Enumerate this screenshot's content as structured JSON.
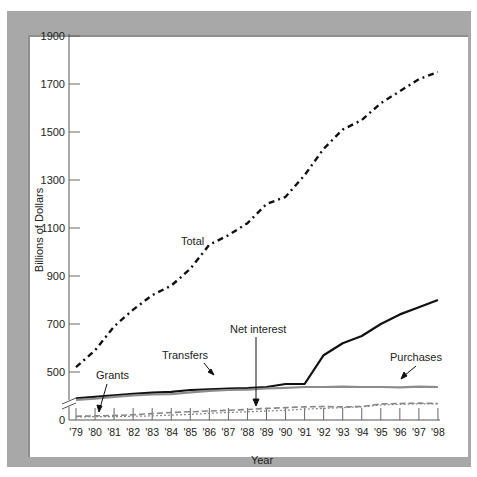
{
  "chart_data": {
    "type": "line",
    "title": "",
    "xlabel": "Year",
    "ylabel": "Billions of Dollars",
    "x": [
      "'79",
      "'80",
      "'81",
      "'82",
      "'83",
      "'84",
      "'85",
      "'86",
      "'87",
      "'88",
      "'89",
      "'90",
      "'91",
      "'92",
      "'93",
      "'94",
      "'95",
      "'96",
      "'97",
      "'98"
    ],
    "yticks": [
      "0",
      "500",
      "700",
      "900",
      "1100",
      "1300",
      "1500",
      "1700",
      "1900"
    ],
    "ylim": [
      0,
      1900
    ],
    "axis_break": "between 0 and 500",
    "grid": false,
    "legend": "inline labels with arrows",
    "series": [
      {
        "name": "Total",
        "style": "dash-dot black",
        "values": [
          520,
          590,
          690,
          760,
          820,
          860,
          930,
          1030,
          1070,
          1120,
          1200,
          1230,
          1320,
          1430,
          1510,
          1550,
          1620,
          1670,
          1720,
          1750
        ]
      },
      {
        "name": "Transfers",
        "style": "solid black",
        "values": [
          290,
          310,
          330,
          350,
          365,
          375,
          400,
          410,
          420,
          425,
          440,
          480,
          480,
          570,
          620,
          650,
          700,
          740,
          770,
          800
        ]
      },
      {
        "name": "Purchases",
        "style": "solid gray",
        "values": [
          270,
          285,
          310,
          330,
          340,
          345,
          370,
          390,
          400,
          405,
          420,
          430,
          440,
          440,
          445,
          440,
          440,
          435,
          445,
          440
        ]
      },
      {
        "name": "Net interest",
        "style": "dashed gray",
        "values": [
          50,
          55,
          60,
          70,
          85,
          100,
          110,
          120,
          130,
          140,
          155,
          165,
          175,
          180,
          175,
          180,
          215,
          220,
          225,
          220
        ]
      },
      {
        "name": "Grants",
        "style": "dotted gray",
        "values": [
          40,
          45,
          45,
          50,
          55,
          65,
          75,
          90,
          100,
          110,
          120,
          130,
          145,
          155,
          165,
          175,
          200,
          210,
          215,
          215
        ]
      }
    ],
    "annotations": [
      "Total",
      "Transfers",
      "Grants",
      "Net interest",
      "Purchases"
    ]
  },
  "labels": {
    "ylabel": "Billions of Dollars",
    "xlabel": "Year",
    "total": "Total",
    "transfers": "Transfers",
    "grants": "Grants",
    "net_interest": "Net interest",
    "purchases": "Purchases"
  }
}
